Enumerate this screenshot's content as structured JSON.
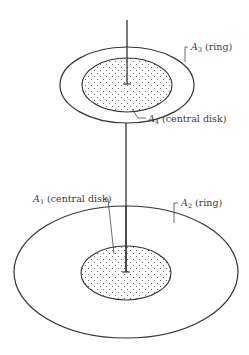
{
  "figure": {
    "width": 249,
    "height": 355,
    "background": "#ffffff",
    "line_color": "#333333",
    "dot_color": "#555555",
    "labels": {
      "a1": {
        "sym": "A",
        "sub": "1",
        "text": " (central disk)"
      },
      "a2": {
        "sym": "A",
        "sub": "2",
        "text": " (ring)"
      },
      "a3": {
        "sym": "A",
        "sub": "3",
        "text": " (ring)"
      },
      "a4": {
        "sym": "A",
        "sub": "4",
        "text": " (central disk)"
      }
    },
    "elements": {
      "upper_ring": {
        "cx": 127,
        "cy": 85,
        "rx": 67,
        "ry": 38
      },
      "upper_disk": {
        "cx": 127,
        "cy": 85,
        "rx": 45,
        "ry": 27
      },
      "lower_ring": {
        "cx": 126,
        "cy": 272,
        "rx": 112,
        "ry": 66
      },
      "lower_disk": {
        "cx": 126,
        "cy": 273,
        "rx": 45,
        "ry": 27
      },
      "axis_x": 126
    }
  }
}
